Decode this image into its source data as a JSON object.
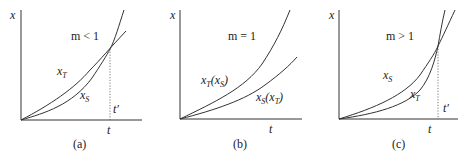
{
  "panels": [
    {
      "caption": "(a)",
      "condition": "m < 1",
      "y_axis_label": "x",
      "x_axis_label": "t",
      "intersection_label": "t′",
      "curve_labels": {
        "upper_left": "x",
        "upper_left_sub": "T",
        "lower": "x",
        "lower_sub": "S"
      }
    },
    {
      "caption": "(b)",
      "condition": "m = 1",
      "y_axis_label": "x",
      "x_axis_label": "t",
      "curve_labels": {
        "upper": "x",
        "upper_sub": "T",
        "upper_paren": "(x",
        "upper_paren_sub": "S",
        "upper_close": ")",
        "lower": "x",
        "lower_sub": "S",
        "lower_paren": "(x",
        "lower_paren_sub": "T",
        "lower_close": ")"
      }
    },
    {
      "caption": "(c)",
      "condition": "m > 1",
      "y_axis_label": "x",
      "x_axis_label": "t",
      "intersection_label": "t′",
      "curve_labels": {
        "upper_left": "x",
        "upper_left_sub": "S",
        "lower": "x",
        "lower_sub": "T"
      }
    }
  ]
}
